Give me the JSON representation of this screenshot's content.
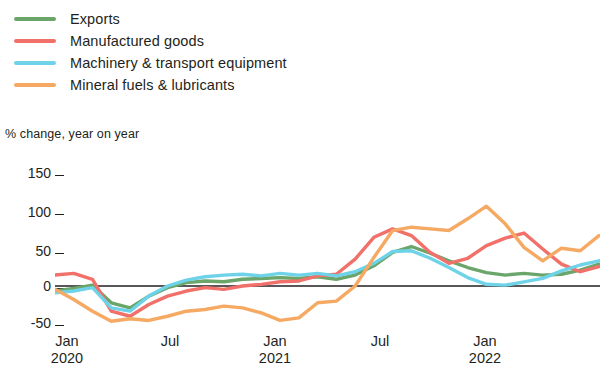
{
  "legend": {
    "position": "top-left",
    "items": [
      {
        "label": "Exports",
        "color": "#6aa56a",
        "key": "exports"
      },
      {
        "label": "Manufactured goods",
        "color": "#f1706a",
        "key": "manufactured_goods"
      },
      {
        "label": "Machinery & transport equipment",
        "color": "#6ed3e8",
        "key": "machinery_transport"
      },
      {
        "label": "Mineral fuels & lubricants",
        "color": "#f5a963",
        "key": "mineral_fuels"
      }
    ]
  },
  "axis": {
    "y_caption": "% change, year on year",
    "y_ticks": [
      "150",
      "100",
      "50",
      "0",
      "-50"
    ],
    "x_ticks": [
      {
        "month": "Jan",
        "year": "2020"
      },
      {
        "month": "Jul",
        "year": ""
      },
      {
        "month": "Jan",
        "year": "2021"
      },
      {
        "month": "Jul",
        "year": ""
      },
      {
        "month": "Jan",
        "year": "2022"
      }
    ]
  },
  "chart_data": {
    "type": "line",
    "title": "",
    "subtitle": "",
    "xlabel": "",
    "ylabel": "% change, year on year",
    "ylim": [
      -50,
      150
    ],
    "yticks": [
      -50,
      0,
      50,
      100,
      150
    ],
    "grid": false,
    "zero_line": true,
    "legend_position": "top-left",
    "x": [
      "2020-01",
      "2020-02",
      "2020-03",
      "2020-04",
      "2020-05",
      "2020-06",
      "2020-07",
      "2020-08",
      "2020-09",
      "2020-10",
      "2020-11",
      "2020-12",
      "2021-01",
      "2021-02",
      "2021-03",
      "2021-04",
      "2021-05",
      "2021-06",
      "2021-07",
      "2021-08",
      "2021-09",
      "2021-10",
      "2021-11",
      "2021-12",
      "2022-01",
      "2022-02",
      "2022-03",
      "2022-04",
      "2022-05",
      "2022-06"
    ],
    "xtick_labels": [
      "Jan 2020",
      "Jul",
      "Jan 2021",
      "Jul",
      "Jan 2022"
    ],
    "xtick_indices": [
      0,
      6,
      12,
      18,
      24
    ],
    "series": [
      {
        "name": "Exports",
        "color": "#6aa56a",
        "values": [
          -6,
          -3,
          1,
          -20,
          -26,
          -12,
          -2,
          4,
          6,
          5,
          8,
          9,
          10,
          9,
          11,
          8,
          13,
          24,
          40,
          47,
          39,
          30,
          22,
          16,
          13,
          15,
          13,
          14,
          19,
          26
        ]
      },
      {
        "name": "Manufactured goods",
        "color": "#f1706a",
        "values": [
          13,
          15,
          8,
          -30,
          -36,
          -22,
          -12,
          -6,
          -2,
          -4,
          0,
          2,
          5,
          6,
          12,
          14,
          32,
          58,
          68,
          60,
          40,
          27,
          33,
          48,
          57,
          63,
          44,
          26,
          17,
          23
        ]
      },
      {
        "name": "Machinery & transport equipment",
        "color": "#6ed3e8",
        "values": [
          -8,
          -6,
          -2,
          -26,
          -30,
          -12,
          0,
          7,
          11,
          13,
          14,
          12,
          15,
          13,
          15,
          12,
          17,
          27,
          41,
          42,
          33,
          22,
          10,
          2,
          1,
          5,
          9,
          18,
          25,
          30
        ]
      },
      {
        "name": "Mineral fuels & lubricants",
        "color": "#f5a963",
        "values": [
          -4,
          -16,
          -30,
          -42,
          -39,
          -41,
          -36,
          -30,
          -28,
          -24,
          -26,
          -32,
          -41,
          -38,
          -20,
          -18,
          0,
          34,
          66,
          70,
          68,
          66,
          80,
          95,
          74,
          46,
          30,
          45,
          42,
          60
        ]
      }
    ]
  }
}
